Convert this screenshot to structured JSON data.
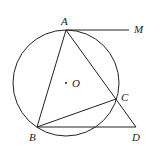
{
  "diagram": {
    "labels": {
      "A": "A",
      "M": "M",
      "O": "O",
      "C": "C",
      "B": "B",
      "D": "D"
    },
    "stroke": "#222222"
  }
}
